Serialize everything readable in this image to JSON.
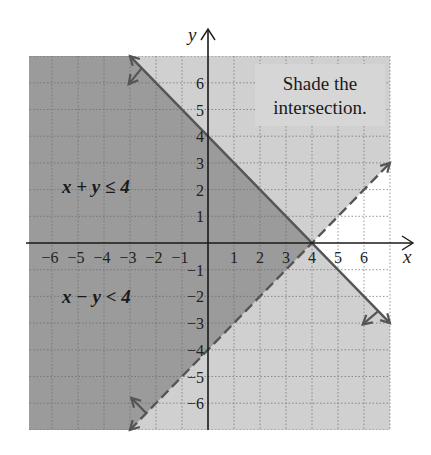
{
  "chart_data": {
    "type": "inequality-region",
    "title": "",
    "xlabel": "x",
    "ylabel": "y",
    "xlim": [
      -7,
      7
    ],
    "ylim": [
      -7,
      7
    ],
    "grid": true,
    "grid_style": "dotted",
    "x_ticks": [
      -6,
      -5,
      -4,
      -3,
      -2,
      -1,
      1,
      2,
      3,
      4,
      5,
      6
    ],
    "y_ticks": [
      6,
      5,
      4,
      3,
      2,
      1,
      -1,
      -2,
      -3,
      -4,
      -5,
      -6
    ],
    "x_tick_labels": [
      "−6",
      "−5",
      "−4",
      "−3",
      "−2",
      "−1",
      "1",
      "2",
      "3",
      "4",
      "5",
      "6"
    ],
    "y_tick_labels": [
      "6",
      "5",
      "4",
      "3",
      "2",
      "1",
      "−1",
      "−2",
      "−3",
      "−4",
      "−5",
      "−6"
    ],
    "inequalities": [
      {
        "label": "x + y ≤ 4",
        "boundary": "x + y = 4",
        "boundary_style": "solid",
        "boundary_points": [
          [
            -3,
            7
          ],
          [
            7,
            -3
          ]
        ],
        "shaded_side": "below-left",
        "label_position": [
          -3.5,
          2
        ]
      },
      {
        "label": "x − y < 4",
        "boundary": "x − y = 4",
        "boundary_style": "dashed",
        "boundary_points": [
          [
            -3,
            -7
          ],
          [
            7,
            3
          ]
        ],
        "shaded_side": "above-left",
        "label_position": [
          -3.5,
          -2
        ]
      }
    ],
    "intersection_vertex": [
      4,
      0
    ],
    "regions": {
      "intersection": {
        "description": "x + y ≤ 4 and x − y < 4",
        "color": "#9b9b9b"
      },
      "single": {
        "description": "satisfies exactly one inequality",
        "color": "#d0d0d0"
      },
      "none": {
        "description": "satisfies neither",
        "color": "#ffffff"
      }
    },
    "annotation": {
      "lines": [
        "Shade the",
        "intersection."
      ]
    }
  },
  "colors": {
    "dark_shade": "#9b9b9b",
    "light_shade": "#d0d0d0",
    "line": "#555555",
    "axis": "#1a1a1a",
    "grid": "#6a6a6a"
  }
}
